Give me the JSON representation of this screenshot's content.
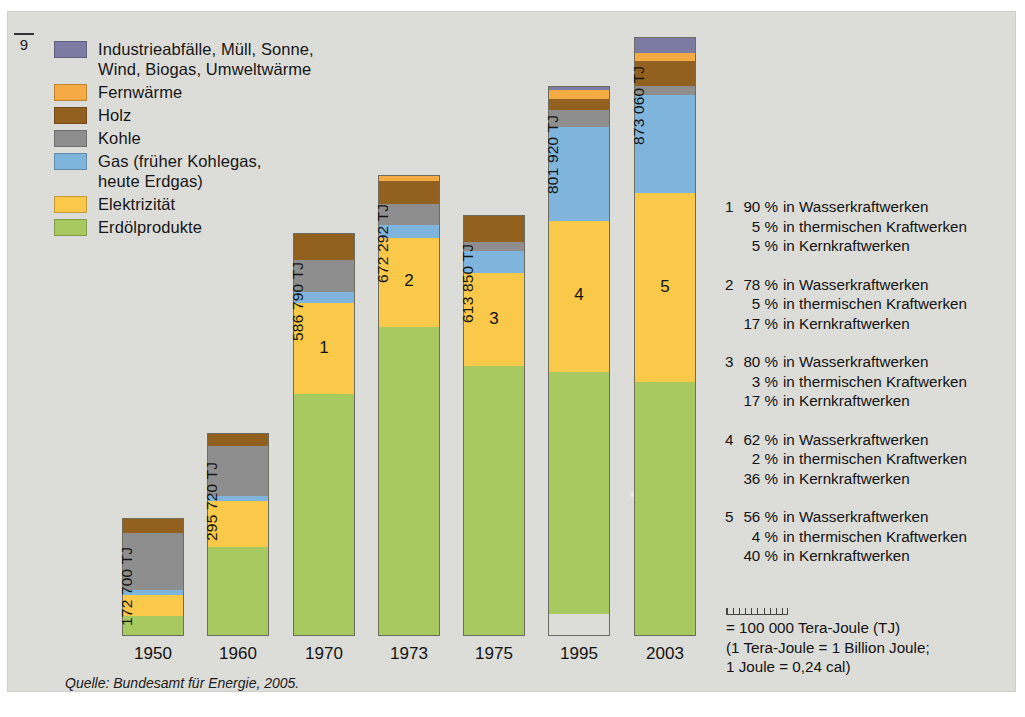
{
  "page_marker": "9",
  "legend": {
    "items": [
      {
        "label": "Industrieabfälle, Müll, Sonne,\nWind, Biogas, Umweltwärme",
        "color": "#7b7ba3",
        "key": "industrieabfaelle"
      },
      {
        "label": "Fernwärme",
        "color": "#f5ab43",
        "key": "fernwaerme"
      },
      {
        "label": "Holz",
        "color": "#92601f",
        "key": "holz"
      },
      {
        "label": "Kohle",
        "color": "#8e8e8e",
        "key": "kohle"
      },
      {
        "label": "Gas (früher Kohlegas,\nheute Erdgas)",
        "color": "#7fb5dd",
        "key": "gas"
      },
      {
        "label": "Elektrizität",
        "color": "#fbc94a",
        "key": "elektrizitaet"
      },
      {
        "label": "Erdölprodukte",
        "color": "#a8c95f",
        "key": "erdoelprodukte"
      }
    ]
  },
  "chart_data": {
    "type": "bar",
    "stacked": true,
    "title": "",
    "xlabel": "",
    "ylabel": "",
    "unit": "TJ",
    "categories": [
      "1950",
      "1960",
      "1970",
      "1973",
      "1975",
      "1995",
      "2003"
    ],
    "totals_label": [
      "172 700 TJ",
      "295 720 TJ",
      "586 790 TJ",
      "672 292 TJ",
      "613 850 TJ",
      "801 920 TJ",
      "873 060 TJ"
    ],
    "totals": [
      172700,
      295720,
      586790,
      672292,
      613850,
      801920,
      873060
    ],
    "bar_annotations": [
      "",
      "",
      "1",
      "2",
      "3",
      "4",
      "5"
    ],
    "series_order_bottom_to_top": [
      "Erdölprodukte",
      "Elektrizität",
      "Gas (früher Kohlegas, heute Erdgas)",
      "Kohle",
      "Holz",
      "Fernwärme",
      "Industrieabfälle, Müll, Sonne, Wind, Biogas, Umweltwärme"
    ],
    "series": [
      {
        "name": "Erdölprodukte",
        "color": "#a8c95f",
        "values": [
          31000,
          131000,
          354000,
          452000,
          395000,
          354000,
          380000
        ]
      },
      {
        "name": "Elektrizität",
        "color": "#fbc94a",
        "values": [
          31000,
          67000,
          133000,
          130000,
          135000,
          220000,
          276000
        ]
      },
      {
        "name": "Gas (früher Kohlegas, heute Erdgas)",
        "color": "#7fb5dd",
        "values": [
          7000,
          8000,
          16000,
          19000,
          33000,
          137000,
          143000
        ]
      },
      {
        "name": "Kohle",
        "color": "#8e8e8e",
        "values": [
          83000,
          72000,
          47000,
          30000,
          13000,
          24000,
          13000
        ]
      },
      {
        "name": "Holz",
        "color": "#92601f",
        "values": [
          21000,
          18000,
          37000,
          33000,
          38000,
          17000,
          36000
        ]
      },
      {
        "name": "Fernwärme",
        "color": "#f5ab43",
        "values": [
          0,
          0,
          0,
          8292,
          0,
          12000,
          12000
        ]
      },
      {
        "name": "Industrieabfälle, Müll, Sonne, Wind, Biogas, Umweltwärme",
        "color": "#7b7ba3",
        "values": [
          0,
          0,
          0,
          0,
          0,
          5000,
          22000
        ]
      }
    ],
    "axis_scale_note": "= 100 000 Tera-Joule (TJ)"
  },
  "notes": [
    {
      "index": "1",
      "lines": [
        {
          "pct": "90 %",
          "text": "in Wasserkraftwerken"
        },
        {
          "pct": "5 %",
          "text": "in thermischen Kraftwerken"
        },
        {
          "pct": "5 %",
          "text": "in Kernkraftwerken"
        }
      ]
    },
    {
      "index": "2",
      "lines": [
        {
          "pct": "78 %",
          "text": "in Wasserkraftwerken"
        },
        {
          "pct": "5 %",
          "text": "in thermischen Kraftwerken"
        },
        {
          "pct": "17 %",
          "text": "in Kernkraftwerken"
        }
      ]
    },
    {
      "index": "3",
      "lines": [
        {
          "pct": "80 %",
          "text": "in Wasserkraftwerken"
        },
        {
          "pct": "3 %",
          "text": "in thermischen Kraftwerken"
        },
        {
          "pct": "17 %",
          "text": "in Kernkraftwerken"
        }
      ]
    },
    {
      "index": "4",
      "lines": [
        {
          "pct": "62 %",
          "text": "in Wasserkraftwerken"
        },
        {
          "pct": "2 %",
          "text": "in thermischen Kraftwerken"
        },
        {
          "pct": "36 %",
          "text": "in Kernkraftwerken"
        }
      ]
    },
    {
      "index": "5",
      "lines": [
        {
          "pct": "56 %",
          "text": "in Wasserkraftwerken"
        },
        {
          "pct": "4 %",
          "text": "in thermischen Kraftwerken"
        },
        {
          "pct": "40 %",
          "text": "in Kernkraftwerken"
        }
      ]
    }
  ],
  "scale_key": {
    "line1": "= 100 000 Tera-Joule (TJ)",
    "line2": "(1 Tera-Joule = 1 Billion Joule;",
    "line3": "1 Joule = 0,24 cal)"
  },
  "source": "Quelle: Bundesamt für Energie, 2005.",
  "geometry": {
    "baseline_y": 625,
    "px_per_tj": 0.000686,
    "bar_left_x": [
      115,
      200,
      286,
      371,
      456,
      541,
      627
    ],
    "bar_width": 62
  }
}
